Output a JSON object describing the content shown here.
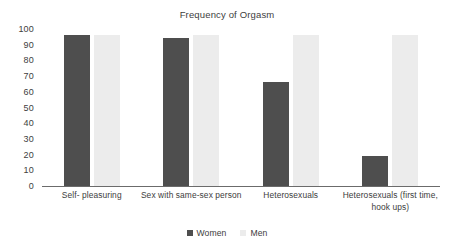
{
  "chart_data": {
    "type": "bar",
    "title": "Frequency of Orgasm",
    "xlabel": "",
    "ylabel": "",
    "ylim": [
      0,
      100
    ],
    "yticks": [
      100,
      90,
      80,
      70,
      60,
      50,
      40,
      30,
      20,
      10,
      0
    ],
    "grid": false,
    "legend_position": "bottom-center",
    "categories": [
      "Self- pleasuring",
      "Sex with same-sex person",
      "Heterosexuals",
      "Heterosexuals (first time, hook ups)"
    ],
    "category_lines": [
      [
        "Self- pleasuring"
      ],
      [
        "Sex with same-sex person"
      ],
      [
        "Heterosexuals"
      ],
      [
        "Heterosexuals (first time,",
        "hook ups)"
      ]
    ],
    "series": [
      {
        "name": "Women",
        "color": "#4e4e4e",
        "values": [
          96,
          94,
          66,
          19
        ]
      },
      {
        "name": "Men",
        "color": "#ececec",
        "values": [
          96,
          96,
          96,
          96
        ]
      }
    ]
  },
  "legend": {
    "items": [
      {
        "label": "Women",
        "swatch": "women-swatch"
      },
      {
        "label": "Men",
        "swatch": "men-swatch"
      }
    ]
  }
}
